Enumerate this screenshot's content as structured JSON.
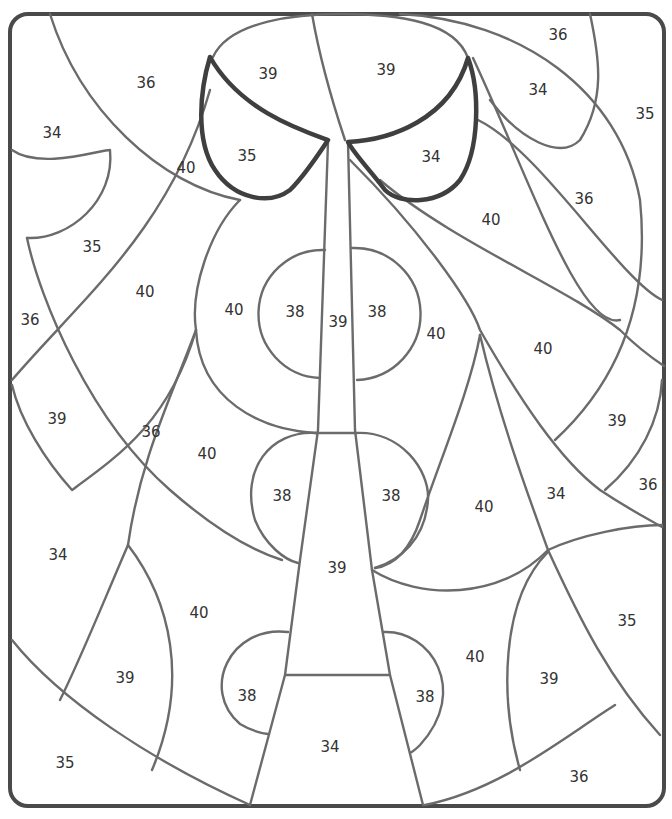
{
  "page": {
    "title_fragment": "...y ... g...",
    "type": "color-by-number worksheet"
  },
  "colors": {
    "outline": "#6b6b6b",
    "frame": "#4a4a4a",
    "emphasis_outline": "#3f3f3f",
    "background": "#ffffff"
  },
  "regions": [
    {
      "label": "36",
      "x": 146,
      "y": 83
    },
    {
      "label": "39",
      "x": 268,
      "y": 74
    },
    {
      "label": "39",
      "x": 386,
      "y": 70
    },
    {
      "label": "36",
      "x": 558,
      "y": 35
    },
    {
      "label": "34",
      "x": 538,
      "y": 90
    },
    {
      "label": "35",
      "x": 645,
      "y": 114
    },
    {
      "label": "34",
      "x": 52,
      "y": 133
    },
    {
      "label": "40",
      "x": 186,
      "y": 168
    },
    {
      "label": "35",
      "x": 247,
      "y": 156
    },
    {
      "label": "34",
      "x": 431,
      "y": 157
    },
    {
      "label": "36",
      "x": 584,
      "y": 199
    },
    {
      "label": "40",
      "x": 491,
      "y": 220
    },
    {
      "label": "35",
      "x": 92,
      "y": 247
    },
    {
      "label": "40",
      "x": 145,
      "y": 292
    },
    {
      "label": "40",
      "x": 234,
      "y": 310
    },
    {
      "label": "38",
      "x": 295,
      "y": 312
    },
    {
      "label": "39",
      "x": 338,
      "y": 322
    },
    {
      "label": "38",
      "x": 377,
      "y": 312
    },
    {
      "label": "40",
      "x": 436,
      "y": 334
    },
    {
      "label": "36",
      "x": 30,
      "y": 320
    },
    {
      "label": "40",
      "x": 543,
      "y": 349
    },
    {
      "label": "39",
      "x": 57,
      "y": 419
    },
    {
      "label": "36",
      "x": 151,
      "y": 432
    },
    {
      "label": "40",
      "x": 207,
      "y": 454
    },
    {
      "label": "39",
      "x": 617,
      "y": 421
    },
    {
      "label": "38",
      "x": 282,
      "y": 496
    },
    {
      "label": "38",
      "x": 391,
      "y": 496
    },
    {
      "label": "40",
      "x": 484,
      "y": 507
    },
    {
      "label": "34",
      "x": 556,
      "y": 494
    },
    {
      "label": "36",
      "x": 648,
      "y": 485
    },
    {
      "label": "34",
      "x": 58,
      "y": 555
    },
    {
      "label": "39",
      "x": 337,
      "y": 568
    },
    {
      "label": "40",
      "x": 199,
      "y": 613
    },
    {
      "label": "35",
      "x": 627,
      "y": 621
    },
    {
      "label": "40",
      "x": 475,
      "y": 657
    },
    {
      "label": "39",
      "x": 125,
      "y": 678
    },
    {
      "label": "38",
      "x": 247,
      "y": 696
    },
    {
      "label": "38",
      "x": 425,
      "y": 697
    },
    {
      "label": "39",
      "x": 549,
      "y": 679
    },
    {
      "label": "34",
      "x": 330,
      "y": 747
    },
    {
      "label": "35",
      "x": 65,
      "y": 763
    },
    {
      "label": "36",
      "x": 579,
      "y": 777
    }
  ]
}
